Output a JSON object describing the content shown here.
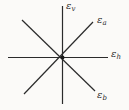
{
  "diagram": {
    "type": "crossing-axes",
    "background_color": "#fbfaf8",
    "line_color": "#2b2b2b",
    "center_dot_color": "#1a1a1a",
    "rays": [
      {
        "id": "vertical",
        "direction": "up",
        "angle_deg": 90,
        "label_symbol": "ε",
        "label_sub": "v"
      },
      {
        "id": "diagonal-a",
        "direction": "up-right",
        "angle_deg": 45,
        "label_symbol": "ε",
        "label_sub": "a"
      },
      {
        "id": "horizontal",
        "direction": "right",
        "angle_deg": 0,
        "label_symbol": "ε",
        "label_sub": "h"
      },
      {
        "id": "diagonal-b",
        "direction": "down-right",
        "angle_deg": -45,
        "label_symbol": "ε",
        "label_sub": "b"
      }
    ]
  }
}
